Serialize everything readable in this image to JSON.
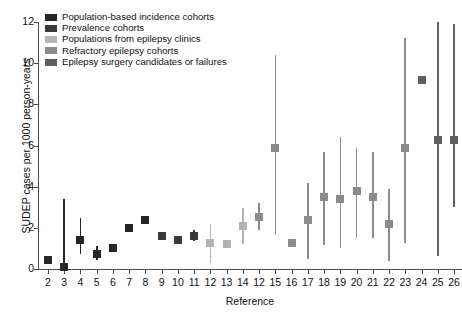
{
  "chart_data": {
    "type": "scatter",
    "title": "",
    "xlabel": "Reference",
    "ylabel": "SUDEP cases per 1000 person-years",
    "ylim": [
      0,
      12
    ],
    "yticks": [
      0,
      2,
      4,
      6,
      8,
      10,
      12
    ],
    "grid": false,
    "legend_position": "top-left",
    "categories": [
      "2",
      "3",
      "4",
      "5",
      "6",
      "7",
      "8",
      "9",
      "10",
      "11",
      "12",
      "13",
      "14",
      "12",
      "15",
      "16",
      "17",
      "18",
      "19",
      "20",
      "21",
      "22",
      "23",
      "24",
      "25",
      "26"
    ],
    "series": [
      {
        "name": "Population-based incidence cohorts",
        "color": "#262626",
        "points": [
          {
            "x": "2",
            "value": 0.45,
            "ci_low": null,
            "ci_high": null
          },
          {
            "x": "3",
            "value": 0.1,
            "ci_low": 0.05,
            "ci_high": 3.4
          },
          {
            "x": "4",
            "value": 1.4,
            "ci_low": 0.75,
            "ci_high": 2.5
          },
          {
            "x": "5",
            "value": 0.75,
            "ci_low": 0.45,
            "ci_high": 1.1
          },
          {
            "x": "6",
            "value": 1.0,
            "ci_low": null,
            "ci_high": null
          },
          {
            "x": "7",
            "value": 2.0,
            "ci_low": null,
            "ci_high": null
          },
          {
            "x": "8",
            "value": 2.4,
            "ci_low": null,
            "ci_high": null
          }
        ]
      },
      {
        "name": "Prevalence cohorts",
        "color": "#3a3a3a",
        "points": [
          {
            "x": "9",
            "value": 1.6,
            "ci_low": null,
            "ci_high": null
          },
          {
            "x": "10",
            "value": 1.4,
            "ci_low": null,
            "ci_high": null
          },
          {
            "x": "11",
            "value": 1.6,
            "ci_low": 1.35,
            "ci_high": 1.9
          }
        ]
      },
      {
        "name": "Populations from epilepsy clinics",
        "color": "#b4b4b4",
        "points": [
          {
            "x": "12",
            "value": 1.25,
            "ci_low": 0.3,
            "ci_high": 2.2
          },
          {
            "x": "13",
            "value": 1.2,
            "ci_low": null,
            "ci_high": null
          },
          {
            "x": "14",
            "value": 2.1,
            "ci_low": 1.2,
            "ci_high": 2.95
          }
        ]
      },
      {
        "name": "Refractory epilepsy cohorts",
        "color": "#8c8c8c",
        "points": [
          {
            "x": "12",
            "value": 2.55,
            "ci_low": 1.9,
            "ci_high": 3.2
          },
          {
            "x": "15",
            "value": 5.9,
            "ci_low": 1.65,
            "ci_high": 10.4
          },
          {
            "x": "16",
            "value": 1.25,
            "ci_low": null,
            "ci_high": null
          },
          {
            "x": "17",
            "value": 2.4,
            "ci_low": 0.5,
            "ci_high": 4.2
          },
          {
            "x": "18",
            "value": 3.5,
            "ci_low": 1.15,
            "ci_high": 5.7
          },
          {
            "x": "19",
            "value": 3.4,
            "ci_low": 1.0,
            "ci_high": 6.4
          },
          {
            "x": "20",
            "value": 3.8,
            "ci_low": 1.5,
            "ci_high": 5.9
          },
          {
            "x": "21",
            "value": 3.5,
            "ci_low": 1.5,
            "ci_high": 5.7
          },
          {
            "x": "22",
            "value": 2.2,
            "ci_low": 0.4,
            "ci_high": 3.9
          },
          {
            "x": "23",
            "value": 5.9,
            "ci_low": 1.25,
            "ci_high": 11.2
          }
        ]
      },
      {
        "name": "Epilepsy surgery candidates or failures",
        "color": "#5e5e5e",
        "points": [
          {
            "x": "24",
            "value": 9.2,
            "ci_low": null,
            "ci_high": null
          },
          {
            "x": "25",
            "value": 6.25,
            "ci_low": 0.65,
            "ci_high": 12.0
          },
          {
            "x": "26",
            "value": 6.25,
            "ci_low": 3.0,
            "ci_high": 11.9
          }
        ]
      }
    ]
  },
  "axis": {
    "ylabel": "SUDEP cases per 1000 person-years",
    "xlabel": "Reference"
  },
  "legend": {
    "items": [
      {
        "label": "Population-based incidence cohorts",
        "color": "#262626"
      },
      {
        "label": "Prevalence cohorts",
        "color": "#3a3a3a"
      },
      {
        "label": "Populations from epilepsy clinics",
        "color": "#b4b4b4"
      },
      {
        "label": "Refractory epilepsy cohorts",
        "color": "#8c8c8c"
      },
      {
        "label": "Epilepsy surgery candidates or failures",
        "color": "#5e5e5e"
      }
    ]
  }
}
